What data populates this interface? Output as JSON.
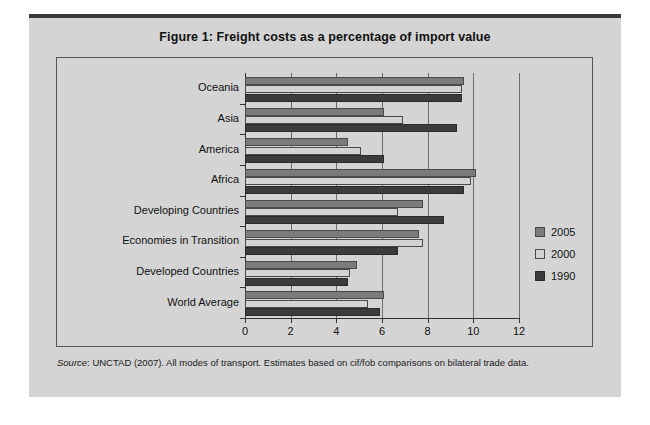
{
  "figure": {
    "title": "Figure 1:  Freight costs as a percentage of import value",
    "source_prefix": "Source",
    "source_text": ": UNCTAD (2007). All modes of transport. Estimates based on cif/fob comparisons on bilateral trade data."
  },
  "colors": {
    "series_2005": "#7b7b7b",
    "series_2000": "#d3d3d3",
    "series_1990": "#3c3c3c",
    "panel_background": "#d4d4d4",
    "grid": "#6d6d6d",
    "axis": "#333333",
    "rule": "#3a3a3a"
  },
  "legend": {
    "position": "right",
    "entries": [
      {
        "label": "2005",
        "swatch": "series_2005"
      },
      {
        "label": "2000",
        "swatch": "series_2000"
      },
      {
        "label": "1990",
        "swatch": "series_1990"
      }
    ]
  },
  "chart_data": {
    "type": "bar",
    "orientation": "horizontal",
    "title": "Figure 1:  Freight costs as a percentage of import value",
    "xlabel": "",
    "ylabel": "",
    "xlim": [
      0,
      12
    ],
    "xticks": [
      0,
      2,
      4,
      6,
      8,
      10,
      12
    ],
    "xticklabels": [
      "0",
      "2",
      "4",
      "6",
      "8",
      "10",
      "12"
    ],
    "grid": true,
    "categories": [
      "Oceania",
      "Asia",
      "America",
      "Africa",
      "Developing Countries",
      "Economies in Transition",
      "Developed Countries",
      "World Average"
    ],
    "series": [
      {
        "name": "2005",
        "values": [
          9.6,
          6.1,
          4.5,
          10.1,
          7.8,
          7.6,
          4.9,
          6.1
        ]
      },
      {
        "name": "2000",
        "values": [
          9.5,
          6.9,
          5.1,
          9.9,
          6.7,
          7.8,
          4.6,
          5.4
        ]
      },
      {
        "name": "1990",
        "values": [
          9.5,
          9.3,
          6.1,
          9.6,
          8.7,
          6.7,
          4.5,
          5.9
        ]
      }
    ]
  }
}
